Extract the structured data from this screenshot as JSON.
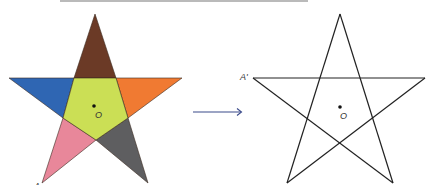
{
  "figure": {
    "top_rule": {
      "x1": 60,
      "x2": 308,
      "y": 1,
      "color": "#777777"
    },
    "left_star": {
      "center_label": "O",
      "vertex_label": "A",
      "colors": {
        "top": "#6b3a26",
        "left": "#2f66b3",
        "right": "#f07a32",
        "bottom_left": "#e8879a",
        "bottom_right": "#5e5e60",
        "center": "#cbdf55",
        "stroke": "#3a2a20"
      }
    },
    "arrow": {
      "color": "#3a4a8a",
      "label": ""
    },
    "right_star": {
      "center_label": "O",
      "vertex_label": "A'",
      "stroke": "#222222"
    }
  }
}
